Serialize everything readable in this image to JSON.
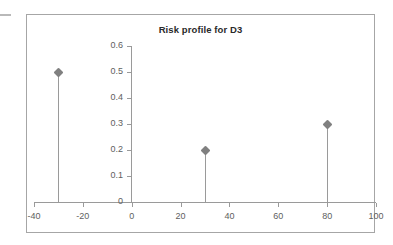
{
  "chart_data": {
    "type": "scatter",
    "title": "Risk profile for D3",
    "xlabel": "",
    "ylabel": "",
    "xlim": [
      -40,
      100
    ],
    "ylim": [
      0,
      0.6
    ],
    "grid": false,
    "legend": "none",
    "marker": "diamond",
    "style": "stem-plot",
    "x": [
      -30,
      30,
      80
    ],
    "values": [
      0.5,
      0.2,
      0.3
    ],
    "points": [
      {
        "x": -30,
        "y": 0.5
      },
      {
        "x": 30,
        "y": 0.2
      },
      {
        "x": 80,
        "y": 0.3
      }
    ],
    "xticks": [
      -40,
      -20,
      0,
      20,
      40,
      60,
      80,
      100
    ],
    "xtick_labels": [
      "-40",
      "-20",
      "0",
      "20",
      "40",
      "60",
      "80",
      "100"
    ],
    "yticks": [
      0,
      0.1,
      0.2,
      0.3,
      0.4,
      0.5,
      0.6
    ],
    "ytick_labels": [
      "0",
      "0.1",
      "0.2",
      "0.3",
      "0.4",
      "0.5",
      "0.6"
    ],
    "colors": {
      "marker": "#808080",
      "stem": "#9a9a9a",
      "axis": "#9a9a9a",
      "frame": "#a6a6a6",
      "title_text": "#2a2a2a",
      "tick_text": "#5e5e5e",
      "background": "#ffffff"
    }
  }
}
